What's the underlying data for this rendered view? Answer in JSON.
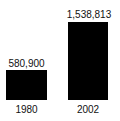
{
  "chart_data": {
    "type": "bar",
    "title": "",
    "subtitle": "",
    "xlabel": "",
    "ylabel": "",
    "categories": [
      "1980",
      "2002"
    ],
    "values": [
      580900,
      1538813
    ],
    "value_labels": [
      "580,900",
      "1,538,813"
    ],
    "series": [
      {
        "name": "",
        "values": [
          580900,
          1538813
        ]
      }
    ],
    "ylim": [
      0,
      1538813
    ],
    "grid": false,
    "legend": false,
    "legend_position": "none",
    "bar_color": "#000000",
    "background_color": "#ffffff",
    "text_color": "#111111",
    "annotations": []
  },
  "chart": {
    "bars": [
      {
        "category": "1980",
        "value_label": "580,900"
      },
      {
        "category": "2002",
        "value_label": "1,538,813"
      }
    ]
  }
}
